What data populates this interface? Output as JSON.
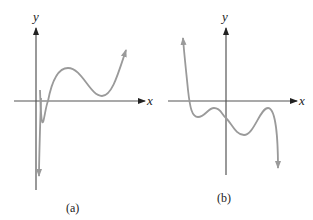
{
  "figure": {
    "panels": [
      {
        "id": "a",
        "caption": "(a)",
        "x_axis_label": "x",
        "y_axis_label": "y",
        "description": "Cubic-like curve: rises from bottom, crosses x-axis, local max above axis, local min just above axis, then rises",
        "curve_color": "#9a9a9a"
      },
      {
        "id": "b",
        "caption": "(b)",
        "x_axis_label": "x",
        "y_axis_label": "y",
        "description": "Quintic-like curve: descends from top-left, crosses x-axis once, wiggles below axis with two local maxima below axis, then falls",
        "curve_color": "#9a9a9a"
      }
    ],
    "colors": {
      "axis": "#555555",
      "curve": "#9a9a9a",
      "background": "#ffffff"
    }
  }
}
